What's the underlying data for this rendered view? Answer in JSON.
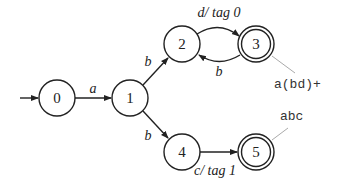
{
  "diagram": {
    "type": "finite-state-automaton",
    "states": [
      {
        "id": "0",
        "label": "0",
        "accepting": false,
        "initial": true
      },
      {
        "id": "1",
        "label": "1",
        "accepting": false
      },
      {
        "id": "2",
        "label": "2",
        "accepting": false
      },
      {
        "id": "3",
        "label": "3",
        "accepting": true
      },
      {
        "id": "4",
        "label": "4",
        "accepting": false
      },
      {
        "id": "5",
        "label": "5",
        "accepting": true
      }
    ],
    "edges": [
      {
        "from": "0",
        "to": "1",
        "label": "a"
      },
      {
        "from": "1",
        "to": "2",
        "label": "b"
      },
      {
        "from": "1",
        "to": "4",
        "label": "b"
      },
      {
        "from": "2",
        "to": "3",
        "label": "d/ tag 0"
      },
      {
        "from": "3",
        "to": "2",
        "label": "b"
      },
      {
        "from": "4",
        "to": "5",
        "label": "c/ tag 1"
      }
    ],
    "annotations": [
      {
        "state": "3",
        "text": "a(bd)+"
      },
      {
        "state": "5",
        "text": "abc"
      }
    ]
  }
}
